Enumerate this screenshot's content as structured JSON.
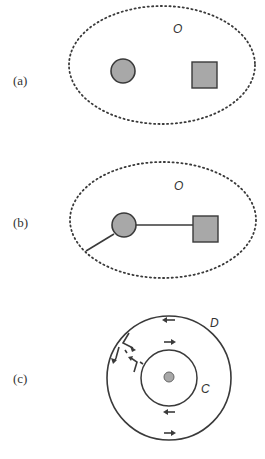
{
  "panels": [
    {
      "id": "a",
      "label": "(a)",
      "region_label": "O",
      "elements": [
        "dotted-ellipse",
        "gray-circle",
        "gray-square"
      ]
    },
    {
      "id": "b",
      "label": "(b)",
      "region_label": "O",
      "elements": [
        "dotted-ellipse",
        "gray-circle",
        "gray-square",
        "line-circle-to-square",
        "line-circle-to-boundary"
      ]
    },
    {
      "id": "c",
      "label": "(c)",
      "outer_label": "D",
      "inner_label": "C",
      "elements": [
        "outer-circle-D",
        "inner-circle-C",
        "center-dot",
        "flow-arrows"
      ]
    }
  ],
  "colors": {
    "stroke": "#3a3a3a",
    "fill_gray": "#a8a8a8",
    "background": "#ffffff"
  }
}
